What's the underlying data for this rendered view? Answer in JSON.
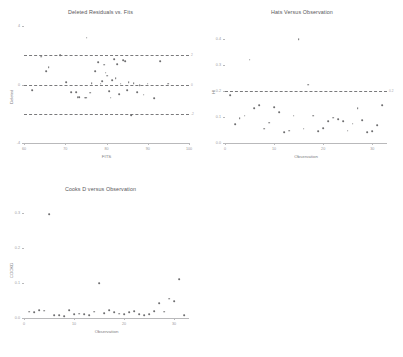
{
  "figure": {
    "background": "#ffffff",
    "marker_color": "#6e6e70",
    "refline_color": "#7a7a7c",
    "axis_color": "#b9b9bb"
  },
  "chart_data": [
    {
      "type": "scatter",
      "id": "deleted-residuals-vs-fits",
      "title": "Deleted Residuals vs. Fits",
      "xlabel": "FITS",
      "ylabel": "Deleted",
      "xlim": [
        60,
        100
      ],
      "ylim": [
        -4,
        4
      ],
      "xticks": [
        60,
        70,
        80,
        90,
        100
      ],
      "xticklabels": [
        "60",
        "70",
        "80",
        "90",
        "100"
      ],
      "yticks": [
        -4,
        0,
        4
      ],
      "yticklabels": [
        "-4",
        "0",
        "4"
      ],
      "grid": false,
      "reference_lines": [
        {
          "y": 2,
          "style": "dashed",
          "label": "2"
        },
        {
          "y": 0,
          "style": "dashed",
          "label": "0"
        },
        {
          "y": -2,
          "style": "dashed",
          "label": "-2"
        }
      ],
      "x": [
        62.0,
        64.2,
        65.3,
        66.0,
        68.8,
        70.2,
        71.4,
        72.6,
        73.0,
        73.4,
        74.8,
        75.0,
        75.2,
        76.0,
        76.4,
        77.3,
        78.0,
        78.6,
        79.0,
        79.4,
        79.8,
        80.2,
        80.6,
        81.0,
        81.4,
        81.8,
        82.2,
        82.6,
        83.0,
        83.4,
        84.0,
        84.6,
        85.0,
        85.4,
        86.0,
        86.6,
        87.4,
        88.0,
        89.0,
        90.0,
        91.6,
        93.0,
        95.0
      ],
      "y": [
        -0.4,
        1.9,
        0.9,
        1.2,
        2.0,
        0.15,
        -0.5,
        -0.5,
        -0.85,
        -0.85,
        -0.9,
        -0.9,
        3.2,
        -0.55,
        0.1,
        0.9,
        1.55,
        0.05,
        0.25,
        1.35,
        0.8,
        0.6,
        -0.45,
        -0.9,
        0.3,
        1.75,
        0.45,
        1.4,
        -0.65,
        0.05,
        1.65,
        1.6,
        -0.4,
        0.15,
        -2.1,
        0.1,
        -0.5,
        -0.05,
        -0.7,
        0.05,
        -0.95,
        1.6,
        0.05
      ]
    },
    {
      "type": "scatter",
      "id": "hats-versus-observation",
      "title": "Hats Versus Observation",
      "xlabel": "Observation",
      "ylabel": "HI",
      "xlim": [
        0,
        33
      ],
      "ylim": [
        0.0,
        0.45
      ],
      "xticks": [
        0,
        10,
        20,
        30
      ],
      "xticklabels": [
        "0",
        "10",
        "20",
        "30"
      ],
      "yticks": [
        0.0,
        0.1,
        0.2,
        0.3,
        0.4
      ],
      "yticklabels": [
        "0.0",
        "0.1",
        "0.2",
        "0.3",
        "0.4"
      ],
      "grid": false,
      "reference_lines": [
        {
          "y": 0.2,
          "style": "dashed",
          "label": "0.2"
        }
      ],
      "x": [
        1,
        2,
        3,
        4,
        5,
        6,
        7,
        8,
        9,
        10,
        11,
        12,
        13,
        14,
        15,
        16,
        17,
        18,
        19,
        20,
        21,
        22,
        23,
        24,
        25,
        26,
        27,
        28,
        29,
        30,
        31,
        32
      ],
      "y": [
        0.185,
        0.072,
        0.095,
        0.105,
        0.32,
        0.135,
        0.145,
        0.055,
        0.078,
        0.138,
        0.118,
        0.042,
        0.048,
        0.105,
        0.4,
        0.055,
        0.225,
        0.105,
        0.045,
        0.058,
        0.085,
        0.098,
        0.092,
        0.085,
        0.048,
        0.075,
        0.135,
        0.088,
        0.042,
        0.045,
        0.068,
        0.145
      ]
    },
    {
      "type": "scatter",
      "id": "cooks-d-versus-observation",
      "title": "Cooks D versus Observation",
      "xlabel": "Observation",
      "ylabel": "COOKD",
      "xlim": [
        0,
        33
      ],
      "ylim": [
        0.0,
        0.33
      ],
      "xticks": [
        0,
        10,
        20,
        30
      ],
      "xticklabels": [
        "0",
        "10",
        "20",
        "30"
      ],
      "yticks": [
        0.0,
        0.1,
        0.2,
        0.3
      ],
      "yticklabels": [
        "0.0",
        "0.1",
        "0.2",
        "0.3"
      ],
      "grid": false,
      "reference_lines": [],
      "x": [
        1,
        2,
        3,
        4,
        5,
        6,
        7,
        8,
        9,
        10,
        11,
        12,
        13,
        14,
        15,
        16,
        17,
        18,
        19,
        20,
        21,
        22,
        23,
        24,
        25,
        26,
        27,
        28,
        29,
        30,
        31,
        32
      ],
      "y": [
        0.018,
        0.016,
        0.022,
        0.021,
        0.295,
        0.008,
        0.009,
        0.006,
        0.022,
        0.011,
        0.012,
        0.01,
        0.009,
        0.018,
        0.1,
        0.013,
        0.022,
        0.016,
        0.012,
        0.011,
        0.016,
        0.02,
        0.01,
        0.009,
        0.01,
        0.02,
        0.042,
        0.018,
        0.055,
        0.048,
        0.11,
        0.008
      ]
    }
  ]
}
